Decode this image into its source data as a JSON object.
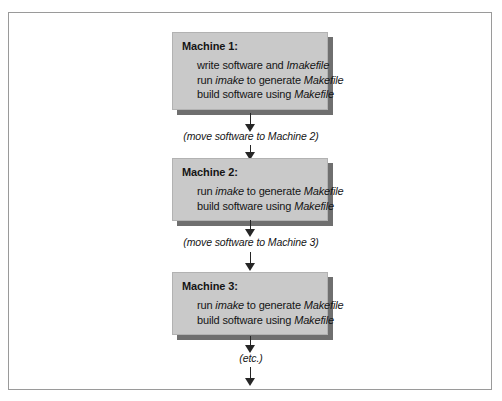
{
  "figure": {
    "border_color": "#9a9a9a",
    "box_fill": "#c9c9c9",
    "box_shadow": "#6f6f6f",
    "arrow_color": "#262626",
    "text_color": "#151515"
  },
  "nodes": [
    {
      "title": "Machine 1:",
      "lines": [
        {
          "parts": [
            {
              "text": "write software and ",
              "italic": false
            },
            {
              "text": "Imakefile",
              "italic": true
            }
          ]
        },
        {
          "parts": [
            {
              "text": "run ",
              "italic": false
            },
            {
              "text": "imake",
              "italic": true
            },
            {
              "text": " to generate ",
              "italic": false
            },
            {
              "text": "Makefile",
              "italic": true
            }
          ]
        },
        {
          "parts": [
            {
              "text": "build software using ",
              "italic": false
            },
            {
              "text": "Makefile",
              "italic": true
            }
          ]
        }
      ]
    },
    {
      "title": "Machine 2:",
      "lines": [
        {
          "parts": [
            {
              "text": "run ",
              "italic": false
            },
            {
              "text": "imake",
              "italic": true
            },
            {
              "text": " to generate ",
              "italic": false
            },
            {
              "text": "Makefile",
              "italic": true
            }
          ]
        },
        {
          "parts": [
            {
              "text": "build software using ",
              "italic": false
            },
            {
              "text": "Makefile",
              "italic": true
            }
          ]
        }
      ]
    },
    {
      "title": "Machine 3:",
      "lines": [
        {
          "parts": [
            {
              "text": "run ",
              "italic": false
            },
            {
              "text": "imake",
              "italic": true
            },
            {
              "text": " to generate ",
              "italic": false
            },
            {
              "text": "Makefile",
              "italic": true
            }
          ]
        },
        {
          "parts": [
            {
              "text": "build software using ",
              "italic": false
            },
            {
              "text": "Makefile",
              "italic": true
            }
          ]
        }
      ]
    }
  ],
  "arrow_labels": [
    "(move software to Machine 2)",
    "(move software to Machine 3)",
    "(etc.)"
  ]
}
